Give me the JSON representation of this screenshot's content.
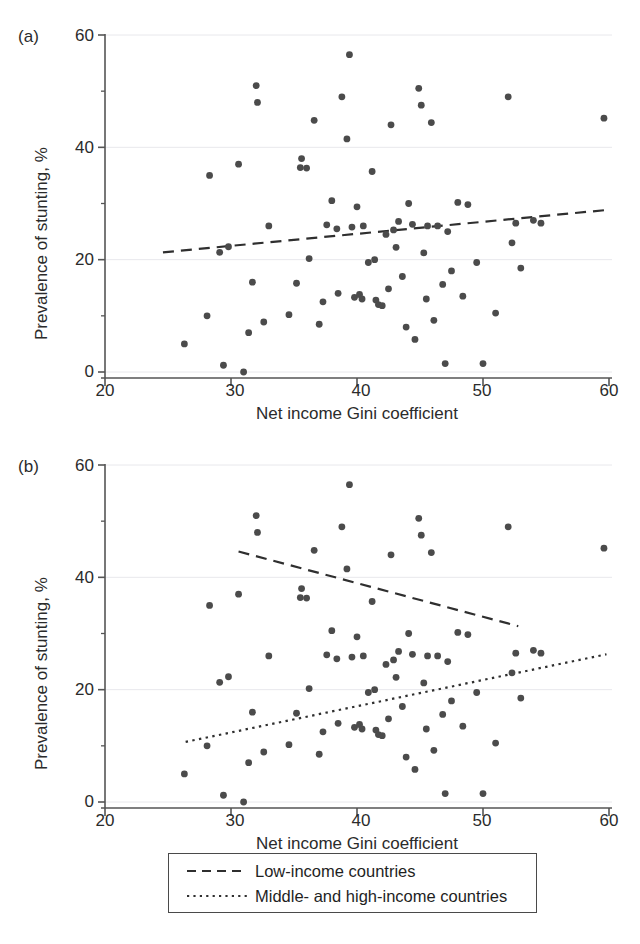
{
  "figure": {
    "panels": [
      {
        "id": "a",
        "label": "(a)",
        "xlabel": "Net income Gini coefficient",
        "ylabel": "Prevalence of stunting, %",
        "xticks": [
          20,
          30,
          40,
          50,
          60
        ],
        "yticks": [
          0,
          20,
          40,
          60
        ]
      },
      {
        "id": "b",
        "label": "(b)",
        "xlabel": "Net income Gini coefficient",
        "ylabel": "Prevalence of stunting, %",
        "xticks": [
          20,
          30,
          40,
          50,
          60
        ],
        "yticks": [
          0,
          20,
          40,
          60
        ]
      }
    ]
  },
  "legend": {
    "items": [
      {
        "label": "Low-income countries",
        "style": "dashed",
        "key": "dashed-line-icon"
      },
      {
        "label": "Middle- and high-income countries",
        "style": "dotted",
        "key": "dotted-line-icon"
      }
    ]
  },
  "colors": {
    "point": "#4b4b4b",
    "axis": "#555555",
    "grid": "#e8e8ec",
    "text": "#2b2b2b",
    "line": "#2f2f2f"
  },
  "chart_data": [
    {
      "type": "scatter",
      "panel": "(a)",
      "title": "",
      "xlabel": "Net income Gini coefficient",
      "ylabel": "Prevalence of stunting, %",
      "xlim": [
        18,
        62
      ],
      "ylim": [
        -2,
        62
      ],
      "xticks": [
        20,
        30,
        40,
        50,
        60
      ],
      "yticks": [
        0,
        20,
        40,
        60
      ],
      "grid": "horizontal",
      "legend": "none",
      "points": [
        [
          26.3,
          5.0
        ],
        [
          28.1,
          10.0
        ],
        [
          28.3,
          35.0
        ],
        [
          29.1,
          21.3
        ],
        [
          29.4,
          1.2
        ],
        [
          29.8,
          22.3
        ],
        [
          30.6,
          37.0
        ],
        [
          31.0,
          0.0
        ],
        [
          31.4,
          7.0
        ],
        [
          31.7,
          16.0
        ],
        [
          32.0,
          51.0
        ],
        [
          32.1,
          48.0
        ],
        [
          32.6,
          8.9
        ],
        [
          33.0,
          26.0
        ],
        [
          34.6,
          10.2
        ],
        [
          35.2,
          15.8
        ],
        [
          35.5,
          36.4
        ],
        [
          35.6,
          38.0
        ],
        [
          36.0,
          36.3
        ],
        [
          36.2,
          20.2
        ],
        [
          36.6,
          44.8
        ],
        [
          37.0,
          8.5
        ],
        [
          37.3,
          12.5
        ],
        [
          37.6,
          26.2
        ],
        [
          38.0,
          30.5
        ],
        [
          38.4,
          25.5
        ],
        [
          38.5,
          14.0
        ],
        [
          38.8,
          49.0
        ],
        [
          39.2,
          41.5
        ],
        [
          39.4,
          56.5
        ],
        [
          39.6,
          25.8
        ],
        [
          39.8,
          13.3
        ],
        [
          40.0,
          29.4
        ],
        [
          40.2,
          13.8
        ],
        [
          40.4,
          13.0
        ],
        [
          40.5,
          26.0
        ],
        [
          40.9,
          19.5
        ],
        [
          41.2,
          35.7
        ],
        [
          41.4,
          20.0
        ],
        [
          41.5,
          12.8
        ],
        [
          41.7,
          12.0
        ],
        [
          42.0,
          11.8
        ],
        [
          42.3,
          24.5
        ],
        [
          42.5,
          14.8
        ],
        [
          42.7,
          44.0
        ],
        [
          42.9,
          25.3
        ],
        [
          43.1,
          22.2
        ],
        [
          43.3,
          26.8
        ],
        [
          43.6,
          17.0
        ],
        [
          43.9,
          8.0
        ],
        [
          44.1,
          30.0
        ],
        [
          44.4,
          26.3
        ],
        [
          44.6,
          5.8
        ],
        [
          44.9,
          50.5
        ],
        [
          45.1,
          47.5
        ],
        [
          45.3,
          21.2
        ],
        [
          45.5,
          13.0
        ],
        [
          45.6,
          26.0
        ],
        [
          45.9,
          44.4
        ],
        [
          46.1,
          9.2
        ],
        [
          46.4,
          26.0
        ],
        [
          46.8,
          15.6
        ],
        [
          47.0,
          1.5
        ],
        [
          47.2,
          25.0
        ],
        [
          47.5,
          18.0
        ],
        [
          48.0,
          30.2
        ],
        [
          48.4,
          13.5
        ],
        [
          48.8,
          29.8
        ],
        [
          49.5,
          19.5
        ],
        [
          50.0,
          1.5
        ],
        [
          51.0,
          10.5
        ],
        [
          52.0,
          49.0
        ],
        [
          52.3,
          23.0
        ],
        [
          52.6,
          26.5
        ],
        [
          53.0,
          18.5
        ],
        [
          54.0,
          27.0
        ],
        [
          54.6,
          26.5
        ],
        [
          59.6,
          45.2
        ]
      ],
      "fit_lines": [
        {
          "name": "All countries",
          "style": "dashed",
          "x_start": 24.6,
          "y_start": 21.3,
          "x_end": 59.6,
          "y_end": 28.8
        }
      ]
    },
    {
      "type": "scatter",
      "panel": "(b)",
      "title": "",
      "xlabel": "Net income Gini coefficient",
      "ylabel": "Prevalence of stunting, %",
      "xlim": [
        18,
        62
      ],
      "ylim": [
        -2,
        62
      ],
      "xticks": [
        20,
        30,
        40,
        50,
        60
      ],
      "yticks": [
        0,
        20,
        40,
        60
      ],
      "grid": "horizontal",
      "legend": "below",
      "points": [
        [
          26.3,
          5.0
        ],
        [
          28.1,
          10.0
        ],
        [
          28.3,
          35.0
        ],
        [
          29.1,
          21.3
        ],
        [
          29.4,
          1.2
        ],
        [
          29.8,
          22.3
        ],
        [
          30.6,
          37.0
        ],
        [
          31.0,
          0.0
        ],
        [
          31.4,
          7.0
        ],
        [
          31.7,
          16.0
        ],
        [
          32.0,
          51.0
        ],
        [
          32.1,
          48.0
        ],
        [
          32.6,
          8.9
        ],
        [
          33.0,
          26.0
        ],
        [
          34.6,
          10.2
        ],
        [
          35.2,
          15.8
        ],
        [
          35.5,
          36.4
        ],
        [
          35.6,
          38.0
        ],
        [
          36.0,
          36.3
        ],
        [
          36.2,
          20.2
        ],
        [
          36.6,
          44.8
        ],
        [
          37.0,
          8.5
        ],
        [
          37.3,
          12.5
        ],
        [
          37.6,
          26.2
        ],
        [
          38.0,
          30.5
        ],
        [
          38.4,
          25.5
        ],
        [
          38.5,
          14.0
        ],
        [
          38.8,
          49.0
        ],
        [
          39.2,
          41.5
        ],
        [
          39.4,
          56.5
        ],
        [
          39.6,
          25.8
        ],
        [
          39.8,
          13.3
        ],
        [
          40.0,
          29.4
        ],
        [
          40.2,
          13.8
        ],
        [
          40.4,
          13.0
        ],
        [
          40.5,
          26.0
        ],
        [
          40.9,
          19.5
        ],
        [
          41.2,
          35.7
        ],
        [
          41.4,
          20.0
        ],
        [
          41.5,
          12.8
        ],
        [
          41.7,
          12.0
        ],
        [
          42.0,
          11.8
        ],
        [
          42.3,
          24.5
        ],
        [
          42.5,
          14.8
        ],
        [
          42.7,
          44.0
        ],
        [
          42.9,
          25.3
        ],
        [
          43.1,
          22.2
        ],
        [
          43.3,
          26.8
        ],
        [
          43.6,
          17.0
        ],
        [
          43.9,
          8.0
        ],
        [
          44.1,
          30.0
        ],
        [
          44.4,
          26.3
        ],
        [
          44.6,
          5.8
        ],
        [
          44.9,
          50.5
        ],
        [
          45.1,
          47.5
        ],
        [
          45.3,
          21.2
        ],
        [
          45.5,
          13.0
        ],
        [
          45.6,
          26.0
        ],
        [
          45.9,
          44.4
        ],
        [
          46.1,
          9.2
        ],
        [
          46.4,
          26.0
        ],
        [
          46.8,
          15.6
        ],
        [
          47.0,
          1.5
        ],
        [
          47.2,
          25.0
        ],
        [
          47.5,
          18.0
        ],
        [
          48.0,
          30.2
        ],
        [
          48.4,
          13.5
        ],
        [
          48.8,
          29.8
        ],
        [
          49.5,
          19.5
        ],
        [
          50.0,
          1.5
        ],
        [
          51.0,
          10.5
        ],
        [
          52.0,
          49.0
        ],
        [
          52.3,
          23.0
        ],
        [
          52.6,
          26.5
        ],
        [
          53.0,
          18.5
        ],
        [
          54.0,
          27.0
        ],
        [
          54.6,
          26.5
        ],
        [
          59.6,
          45.2
        ]
      ],
      "fit_lines": [
        {
          "name": "Low-income countries",
          "style": "dashed",
          "x_start": 30.6,
          "y_start": 44.6,
          "x_end": 52.8,
          "y_end": 31.3
        },
        {
          "name": "Middle- and high-income countries",
          "style": "dotted",
          "x_start": 26.4,
          "y_start": 10.7,
          "x_end": 59.8,
          "y_end": 26.3
        }
      ]
    }
  ]
}
